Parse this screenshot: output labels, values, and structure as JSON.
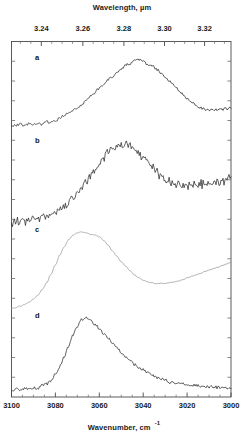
{
  "figure": {
    "top_axis": {
      "title": "Wavelength,  µm",
      "tick_labels": [
        "3.24",
        "3.26",
        "3.28",
        "3.30",
        "3.32"
      ]
    },
    "bottom_axis": {
      "title": "Wavenumber, cm",
      "title_superscript": "-1",
      "tick_labels": [
        "3100",
        "3080",
        "3060",
        "3040",
        "3020",
        "3000"
      ]
    },
    "trace_labels": [
      "a",
      "b",
      "c",
      "d"
    ]
  },
  "chart_data": {
    "type": "line",
    "title": "",
    "xlabel": "Wavenumber, cm-1",
    "ylabel": "",
    "secondary_xlabel": "Wavelength, µm",
    "grid": false,
    "legend": "none",
    "xlim": [
      3100,
      3000
    ],
    "x_inverted": true,
    "xticks": [
      3100,
      3080,
      3060,
      3040,
      3020,
      3000
    ],
    "secondary_xticks": [
      3.24,
      3.26,
      3.28,
      3.3,
      3.32
    ],
    "x": [
      3100,
      3098,
      3096,
      3094,
      3092,
      3090,
      3088,
      3086,
      3084,
      3082,
      3080,
      3078,
      3076,
      3074,
      3072,
      3070,
      3068,
      3066,
      3064,
      3062,
      3060,
      3058,
      3056,
      3054,
      3052,
      3050,
      3048,
      3046,
      3044,
      3042,
      3040,
      3038,
      3036,
      3034,
      3032,
      3030,
      3028,
      3026,
      3024,
      3022,
      3020,
      3018,
      3016,
      3014,
      3012,
      3010,
      3008,
      3006,
      3004,
      3002,
      3000
    ],
    "series": [
      {
        "name": "a",
        "color": "#2b2b2b",
        "noise": "moderate",
        "peak_wavenumber": 3060,
        "values": [
          0.13,
          0.12,
          0.14,
          0.12,
          0.15,
          0.13,
          0.16,
          0.14,
          0.17,
          0.16,
          0.19,
          0.22,
          0.26,
          0.3,
          0.33,
          0.36,
          0.4,
          0.46,
          0.52,
          0.57,
          0.63,
          0.68,
          0.73,
          0.78,
          0.83,
          0.88,
          0.93,
          0.96,
          0.99,
          1.0,
          0.98,
          0.95,
          0.92,
          0.88,
          0.83,
          0.78,
          0.72,
          0.66,
          0.6,
          0.54,
          0.48,
          0.43,
          0.39,
          0.36,
          0.34,
          0.33,
          0.33,
          0.34,
          0.34,
          0.35,
          0.35
        ]
      },
      {
        "name": "b",
        "color": "#2b2b2b",
        "noise": "high",
        "peak_wavenumber": 3063,
        "values": [
          0.05,
          0.08,
          0.06,
          0.1,
          0.08,
          0.12,
          0.1,
          0.14,
          0.13,
          0.17,
          0.16,
          0.22,
          0.26,
          0.31,
          0.36,
          0.42,
          0.48,
          0.55,
          0.62,
          0.69,
          0.76,
          0.83,
          0.89,
          0.94,
          0.97,
          0.99,
          1.0,
          0.98,
          0.95,
          0.9,
          0.84,
          0.78,
          0.72,
          0.66,
          0.61,
          0.57,
          0.54,
          0.52,
          0.51,
          0.5,
          0.5,
          0.51,
          0.51,
          0.52,
          0.52,
          0.53,
          0.53,
          0.54,
          0.55,
          0.56,
          0.57
        ]
      },
      {
        "name": "c",
        "color": "#9a9a9a",
        "noise": "low",
        "peak_wavenumber": 3072,
        "values": [
          0.02,
          0.03,
          0.05,
          0.07,
          0.1,
          0.14,
          0.19,
          0.26,
          0.35,
          0.46,
          0.58,
          0.7,
          0.81,
          0.9,
          0.96,
          0.99,
          1.0,
          0.99,
          0.97,
          0.96,
          0.94,
          0.89,
          0.83,
          0.76,
          0.69,
          0.62,
          0.56,
          0.5,
          0.45,
          0.41,
          0.38,
          0.36,
          0.35,
          0.34,
          0.34,
          0.34,
          0.35,
          0.36,
          0.37,
          0.39,
          0.41,
          0.43,
          0.45,
          0.47,
          0.49,
          0.51,
          0.53,
          0.55,
          0.57,
          0.59,
          0.61
        ]
      },
      {
        "name": "d",
        "color": "#2b2b2b",
        "noise": "moderate",
        "peak_wavenumber": 3072,
        "values": [
          0.08,
          0.09,
          0.08,
          0.1,
          0.09,
          0.11,
          0.1,
          0.13,
          0.15,
          0.2,
          0.28,
          0.38,
          0.5,
          0.64,
          0.78,
          0.9,
          0.98,
          1.0,
          0.97,
          0.92,
          0.86,
          0.8,
          0.74,
          0.68,
          0.62,
          0.56,
          0.51,
          0.46,
          0.41,
          0.37,
          0.33,
          0.3,
          0.27,
          0.24,
          0.22,
          0.2,
          0.18,
          0.17,
          0.16,
          0.15,
          0.14,
          0.13,
          0.13,
          0.12,
          0.12,
          0.12,
          0.11,
          0.11,
          0.11,
          0.1,
          0.1
        ]
      }
    ]
  }
}
